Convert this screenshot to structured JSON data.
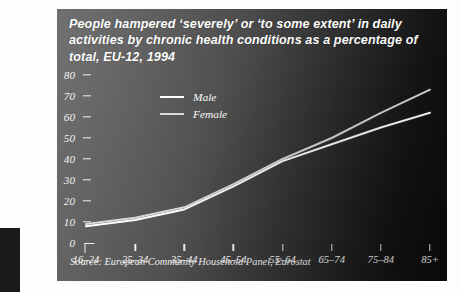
{
  "figure": {
    "title": "People hampered ‘severely’ or ‘to some extent’ in daily activities by chronic health conditions as a percentage of total, EU-12, 1994",
    "source": "Source: European Community Household Panel, Eurostat",
    "panel_background_dark": "#0b0b0b",
    "panel_background_light": "#6a6a6a",
    "text_color": "#f4f4f4"
  },
  "legend": {
    "position": "top-left-inside",
    "entries": [
      {
        "label": "Male",
        "color": "#ffffff"
      },
      {
        "label": "Female",
        "color": "#d8d8d8"
      }
    ]
  },
  "axes": {
    "y_ticks": [
      "0",
      "10",
      "20",
      "30",
      "40",
      "50",
      "60",
      "70",
      "80"
    ],
    "x_ticks": [
      "16–24",
      "25–34",
      "35–44",
      "45–54",
      "55–64",
      "65–74",
      "75–84",
      "85+"
    ]
  },
  "chart_data": {
    "type": "line",
    "title": "People hampered ‘severely’ or ‘to some extent’ in daily activities by chronic health conditions as a percentage of total, EU-12, 1994",
    "xlabel": "",
    "ylabel": "",
    "categories": [
      "16–24",
      "25–34",
      "35–44",
      "45–54",
      "55–64",
      "65–74",
      "75–84",
      "85+"
    ],
    "series": [
      {
        "name": "Male",
        "values": [
          8,
          11,
          16,
          27,
          39,
          47,
          55,
          62
        ],
        "color": "#ffffff"
      },
      {
        "name": "Female",
        "values": [
          9,
          12,
          17,
          28,
          40,
          50,
          62,
          73
        ],
        "color": "#d8d8d8"
      }
    ],
    "ylim": [
      0,
      80
    ],
    "ytick_step": 10,
    "grid": false,
    "legend_position": "upper left",
    "source": "Source: European Community Household Panel, Eurostat"
  }
}
